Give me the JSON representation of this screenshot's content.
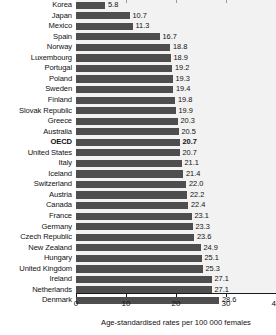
{
  "chart_data": {
    "type": "bar",
    "orientation": "horizontal",
    "title": "",
    "subtitle": "",
    "xlabel": "Age-standardised rates per 100 000 females",
    "ylabel": "",
    "xlim": [
      0,
      40
    ],
    "xticks": [
      0,
      10,
      20,
      30,
      40
    ],
    "xtick_labels": [
      "0",
      "10",
      "20",
      "30",
      "40"
    ],
    "grid": false,
    "legend": null,
    "bar_color": "#4e4e4e",
    "plot_background": "#f2f2f2",
    "highlight_category": "OECD",
    "categories": [
      "Korea",
      "Japan",
      "Mexico",
      "Spain",
      "Norway",
      "Luxembourg",
      "Portugal",
      "Poland",
      "Sweden",
      "Finland",
      "Slovak Republic",
      "Greece",
      "Australia",
      "OECD",
      "United States",
      "Italy",
      "Iceland",
      "Switzerland",
      "Austria",
      "Canada",
      "France",
      "Germany",
      "Czech Republic",
      "New Zealand",
      "Hungary",
      "United Kingdom",
      "Ireland",
      "Netherlands",
      "Denmark"
    ],
    "values": [
      5.8,
      10.7,
      11.3,
      16.7,
      18.8,
      18.9,
      19.2,
      19.3,
      19.4,
      19.8,
      19.9,
      20.3,
      20.5,
      20.7,
      20.7,
      21.1,
      21.4,
      22.0,
      22.2,
      22.4,
      23.1,
      23.3,
      23.6,
      24.9,
      25.1,
      25.3,
      27.1,
      27.1,
      28.6
    ],
    "value_labels": [
      "5.8",
      "10.7",
      "11.3",
      "16.7",
      "18.8",
      "18.9",
      "19.2",
      "19.3",
      "19.4",
      "19.8",
      "19.9",
      "20.3",
      "20.5",
      "20.7",
      "20.7",
      "21.1",
      "21.4",
      "22.0",
      "22.2",
      "22.4",
      "23.1",
      "23.3",
      "23.6",
      "24.9",
      "25.1",
      "25.3",
      "27.1",
      "27.1",
      "28.6"
    ]
  }
}
